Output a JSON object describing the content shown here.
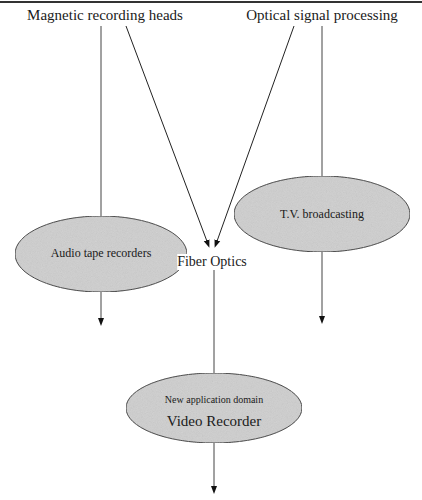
{
  "diagram": {
    "sources": [
      {
        "id": "magnetic",
        "label": "Magnetic recording heads"
      },
      {
        "id": "optical",
        "label": "Optical signal processing"
      }
    ],
    "nodes": [
      {
        "id": "audio",
        "label": "Audio tape recorders",
        "shape": "ellipse"
      },
      {
        "id": "tv",
        "label": "T.V. broadcasting",
        "shape": "ellipse"
      },
      {
        "id": "fiber",
        "label": "Fiber Optics",
        "shape": "text"
      },
      {
        "id": "video",
        "sublabel": "New application domain",
        "label": "Video Recorder",
        "shape": "ellipse"
      }
    ],
    "edges": [
      {
        "from": "magnetic",
        "to": "audio"
      },
      {
        "from": "magnetic",
        "to": "fiber"
      },
      {
        "from": "optical",
        "to": "fiber"
      },
      {
        "from": "optical",
        "to": "tv"
      },
      {
        "from": "fiber",
        "to": "video"
      }
    ],
    "colors": {
      "ellipse_fill": "#d0d0d0",
      "ellipse_stroke": "#333333",
      "line": "#444444",
      "background": "#ffffff"
    }
  }
}
